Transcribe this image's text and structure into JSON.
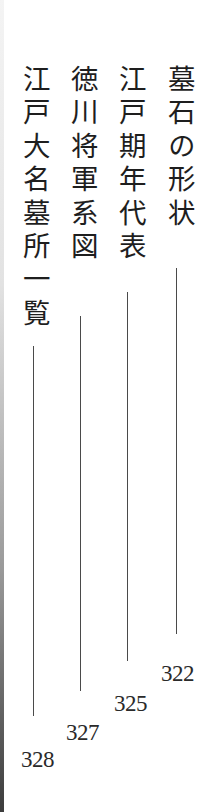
{
  "toc": {
    "entries": [
      {
        "title": "墓石の形状",
        "page": "322"
      },
      {
        "title": "江戸期年代表",
        "page": "325"
      },
      {
        "title": "徳川将軍系図",
        "page": "327"
      },
      {
        "title": "江戸大名墓所一覧",
        "page": "328"
      }
    ]
  },
  "colors": {
    "text": "#1e1e1e",
    "leader_line": "#4a4a4a",
    "background": "#ffffff"
  }
}
